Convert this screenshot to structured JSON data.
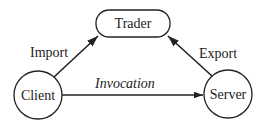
{
  "diagram": {
    "nodes": {
      "trader": {
        "label": "Trader",
        "shape": "rounded-rectangle"
      },
      "client": {
        "label": "Client",
        "shape": "circle"
      },
      "server": {
        "label": "Server",
        "shape": "circle"
      }
    },
    "edges": {
      "import": {
        "label": "Import",
        "from": "Client",
        "to": "Trader"
      },
      "export": {
        "label": "Export",
        "from": "Server",
        "to": "Trader"
      },
      "invocation": {
        "label": "Invocation",
        "from": "Client",
        "to": "Server"
      }
    },
    "colors": {
      "stroke": "#222222",
      "background": "#ffffff"
    }
  }
}
